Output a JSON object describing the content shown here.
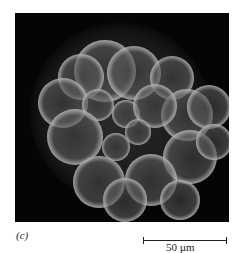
{
  "figure": {
    "panel_label": "(c)",
    "scale_bar": {
      "text": "50 µm",
      "length_px": 84
    },
    "image": {
      "description": "Darkfield micrograph of a spherical cluster of cells (embryo-like morula) on black background",
      "background_color": "#050505",
      "cells": [
        {
          "x": 75,
          "y": 41,
          "r": 31
        },
        {
          "x": 51,
          "y": 47,
          "r": 23
        },
        {
          "x": 104,
          "y": 43,
          "r": 27
        },
        {
          "x": 142,
          "y": 48,
          "r": 22
        },
        {
          "x": 33,
          "y": 73,
          "r": 25
        },
        {
          "x": 157,
          "y": 85,
          "r": 26
        },
        {
          "x": 179,
          "y": 77,
          "r": 22
        },
        {
          "x": 68,
          "y": 75,
          "r": 16
        },
        {
          "x": 96,
          "y": 84,
          "r": 14
        },
        {
          "x": 125,
          "y": 76,
          "r": 22
        },
        {
          "x": 45,
          "y": 107,
          "r": 28
        },
        {
          "x": 86,
          "y": 117,
          "r": 14
        },
        {
          "x": 108,
          "y": 102,
          "r": 13
        },
        {
          "x": 160,
          "y": 127,
          "r": 27
        },
        {
          "x": 184,
          "y": 112,
          "r": 18
        },
        {
          "x": 69,
          "y": 152,
          "r": 26
        },
        {
          "x": 121,
          "y": 150,
          "r": 26
        },
        {
          "x": 95,
          "y": 170,
          "r": 22
        },
        {
          "x": 150,
          "y": 170,
          "r": 20
        }
      ]
    }
  }
}
